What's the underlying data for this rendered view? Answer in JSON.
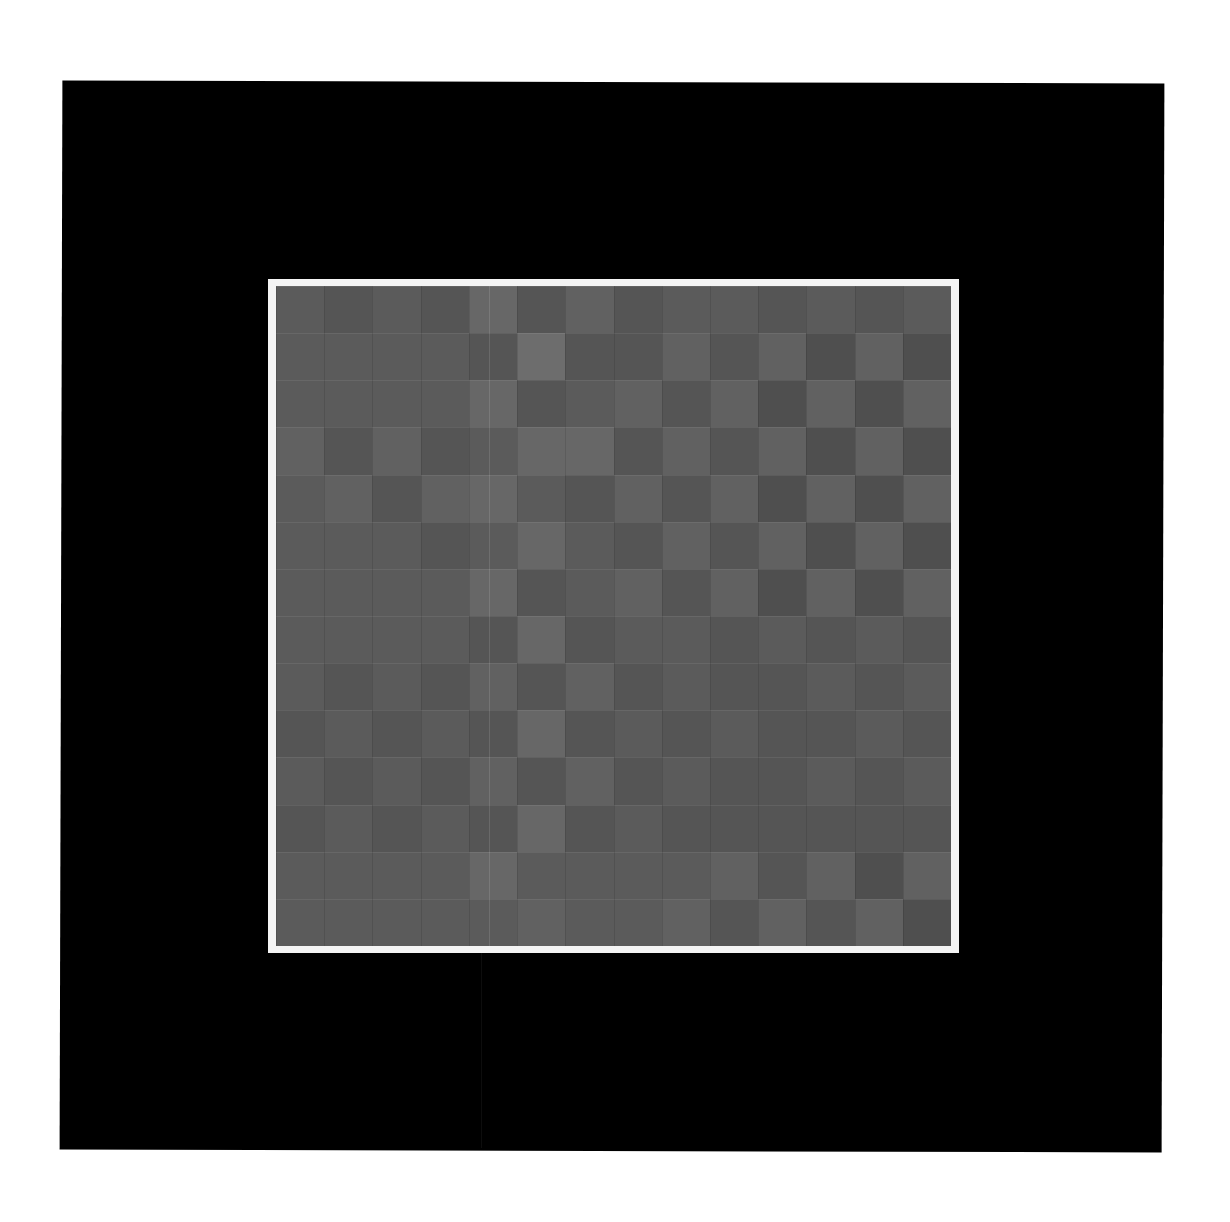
{
  "image": {
    "description": "Photograph/scan of a 14x14 grayscale checkerboard-like grid of squares with a white frame, mounted on a black panel on a white background",
    "background_color": "#ffffff",
    "panel_color": "#000000",
    "frame_color": "#f4f4f4"
  },
  "grid": {
    "rows": 14,
    "cols": 14,
    "palette": [
      "#4f4f4f",
      "#555555",
      "#5b5b5b",
      "#616161",
      "#676767",
      "#6d6d6d"
    ],
    "levels": [
      [
        2,
        1,
        2,
        1,
        4,
        1,
        3,
        1,
        2,
        2,
        1,
        2,
        1,
        2
      ],
      [
        2,
        2,
        2,
        2,
        1,
        5,
        1,
        1,
        3,
        1,
        3,
        0,
        3,
        0
      ],
      [
        2,
        2,
        2,
        2,
        4,
        1,
        2,
        3,
        1,
        3,
        0,
        3,
        0,
        3
      ],
      [
        3,
        1,
        3,
        1,
        2,
        4,
        4,
        1,
        3,
        1,
        3,
        0,
        3,
        0
      ],
      [
        2,
        3,
        1,
        3,
        4,
        2,
        1,
        3,
        1,
        3,
        0,
        3,
        0,
        3
      ],
      [
        2,
        2,
        2,
        1,
        2,
        4,
        2,
        1,
        3,
        1,
        3,
        0,
        3,
        0
      ],
      [
        2,
        2,
        2,
        2,
        4,
        1,
        2,
        3,
        1,
        3,
        0,
        3,
        0,
        3
      ],
      [
        2,
        2,
        2,
        2,
        1,
        4,
        1,
        2,
        2,
        1,
        2,
        1,
        2,
        1
      ],
      [
        2,
        1,
        2,
        1,
        3,
        1,
        3,
        1,
        2,
        1,
        1,
        2,
        1,
        2
      ],
      [
        1,
        2,
        1,
        2,
        1,
        4,
        1,
        2,
        1,
        2,
        1,
        1,
        2,
        1
      ],
      [
        2,
        1,
        2,
        1,
        3,
        1,
        3,
        1,
        2,
        1,
        1,
        2,
        1,
        2
      ],
      [
        1,
        2,
        1,
        2,
        1,
        4,
        1,
        2,
        1,
        1,
        1,
        1,
        1,
        1
      ],
      [
        2,
        2,
        2,
        2,
        4,
        2,
        2,
        2,
        2,
        3,
        1,
        3,
        0,
        3
      ],
      [
        2,
        2,
        2,
        2,
        2,
        3,
        2,
        2,
        3,
        1,
        3,
        1,
        3,
        0
      ]
    ]
  }
}
